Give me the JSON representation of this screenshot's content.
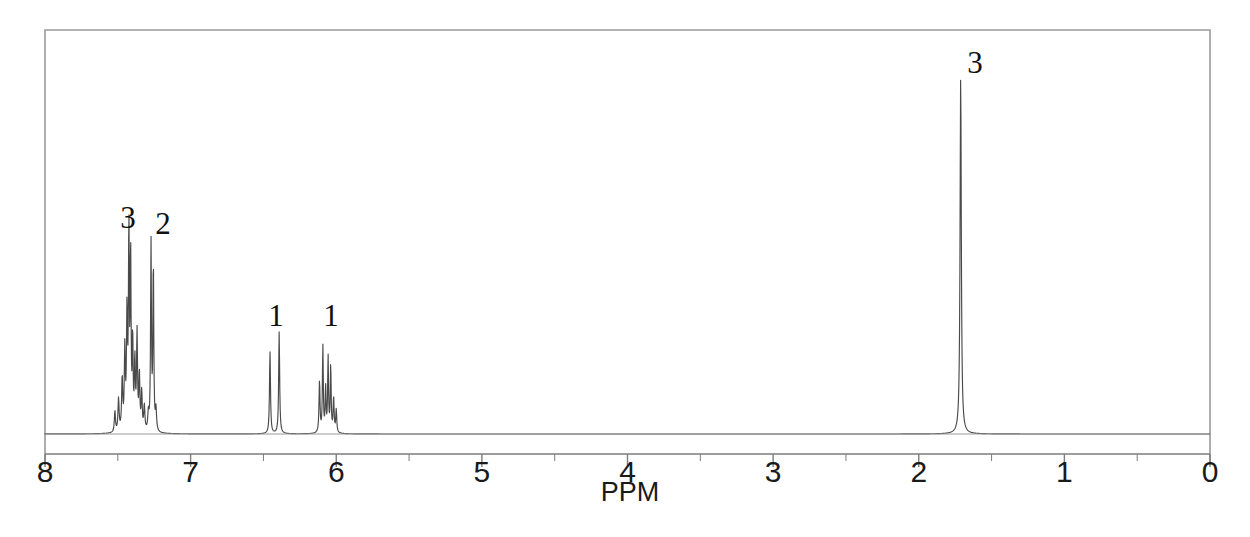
{
  "figure": {
    "kind": "nmr-spectrum",
    "background_color": "#ffffff",
    "trace_color": "#4a4a4a",
    "frame_color": "#9a9a9a",
    "axis_color": "#7d7d7d",
    "label_color": "#1a1a1a",
    "width": 1250,
    "height": 537
  },
  "frame": {
    "left": 45,
    "top": 30,
    "right": 1210,
    "bottom": 434
  },
  "axis": {
    "title": "PPM",
    "title_x": 630,
    "title_y": 482,
    "line_y": 454,
    "left_x": 45,
    "right_x": 1210,
    "ppm_min": 0,
    "ppm_max": 8,
    "px_per_ppm": 145.9,
    "major_tick_length": 13,
    "minor_tick_length": 7,
    "major_ticks": [
      8,
      7,
      6,
      5,
      4,
      3,
      2,
      1,
      0
    ],
    "minor_ticks": [
      7.5,
      6.5,
      5.5,
      4.5,
      3.5,
      2.5,
      1.5,
      0.5
    ],
    "tick_labels": [
      "8",
      "7",
      "6",
      "5",
      "4",
      "3",
      "2",
      "1",
      "0"
    ],
    "tick_label_y": 460
  },
  "baseline": {
    "y": 434
  },
  "chart_data": {
    "type": "line",
    "title": "",
    "subtitle": "",
    "xlabel": "PPM",
    "ylabel": "",
    "xlim": [
      8,
      0
    ],
    "ylim": [
      0,
      1
    ],
    "x_reversed": true,
    "grid": false,
    "legend": "none",
    "annotations": [
      {
        "text": "3",
        "ppm": 7.42,
        "x_px": 128,
        "y_px": 228,
        "role": "integral-count"
      },
      {
        "text": "2",
        "ppm": 7.26,
        "x_px": 163,
        "y_px": 234,
        "role": "integral-count"
      },
      {
        "text": "1",
        "ppm": 6.42,
        "x_px": 276,
        "y_px": 326,
        "role": "integral-count"
      },
      {
        "text": "1",
        "ppm": 6.05,
        "x_px": 331,
        "y_px": 326,
        "role": "integral-count"
      },
      {
        "text": "3",
        "ppm": 1.71,
        "x_px": 975,
        "y_px": 73,
        "role": "integral-count"
      }
    ],
    "peaks": [
      {
        "ppm": 7.52,
        "height": 0.055,
        "width_ppm": 0.009,
        "group": "aromatic-a"
      },
      {
        "ppm": 7.495,
        "height": 0.085,
        "width_ppm": 0.009,
        "group": "aromatic-a"
      },
      {
        "ppm": 7.47,
        "height": 0.135,
        "width_ppm": 0.009,
        "group": "aromatic-a"
      },
      {
        "ppm": 7.452,
        "height": 0.205,
        "width_ppm": 0.008,
        "group": "aromatic-a"
      },
      {
        "ppm": 7.437,
        "height": 0.3,
        "width_ppm": 0.008,
        "group": "aromatic-a"
      },
      {
        "ppm": 7.424,
        "height": 0.52,
        "width_ppm": 0.007,
        "group": "aromatic-a"
      },
      {
        "ppm": 7.412,
        "height": 0.455,
        "width_ppm": 0.007,
        "group": "aromatic-a"
      },
      {
        "ppm": 7.398,
        "height": 0.23,
        "width_ppm": 0.007,
        "group": "aromatic-a"
      },
      {
        "ppm": 7.383,
        "height": 0.175,
        "width_ppm": 0.008,
        "group": "aromatic-a"
      },
      {
        "ppm": 7.368,
        "height": 0.25,
        "width_ppm": 0.008,
        "group": "aromatic-a"
      },
      {
        "ppm": 7.352,
        "height": 0.145,
        "width_ppm": 0.008,
        "group": "aromatic-a"
      },
      {
        "ppm": 7.336,
        "height": 0.1,
        "width_ppm": 0.008,
        "group": "aromatic-a"
      },
      {
        "ppm": 7.318,
        "height": 0.065,
        "width_ppm": 0.009,
        "group": "aromatic-a"
      },
      {
        "ppm": 7.29,
        "height": 0.045,
        "width_ppm": 0.009,
        "group": "aromatic-b"
      },
      {
        "ppm": 7.272,
        "height": 0.49,
        "width_ppm": 0.007,
        "group": "aromatic-b"
      },
      {
        "ppm": 7.256,
        "height": 0.44,
        "width_ppm": 0.007,
        "group": "aromatic-b"
      },
      {
        "ppm": 7.238,
        "height": 0.055,
        "width_ppm": 0.009,
        "group": "aromatic-b"
      },
      {
        "ppm": 6.455,
        "height": 0.215,
        "width_ppm": 0.008,
        "group": "vinyl-d"
      },
      {
        "ppm": 6.392,
        "height": 0.265,
        "width_ppm": 0.008,
        "group": "vinyl-d"
      },
      {
        "ppm": 6.115,
        "height": 0.135,
        "width_ppm": 0.008,
        "group": "vinyl-m"
      },
      {
        "ppm": 6.092,
        "height": 0.225,
        "width_ppm": 0.007,
        "group": "vinyl-m"
      },
      {
        "ppm": 6.073,
        "height": 0.115,
        "width_ppm": 0.007,
        "group": "vinyl-m"
      },
      {
        "ppm": 6.056,
        "height": 0.195,
        "width_ppm": 0.007,
        "group": "vinyl-m"
      },
      {
        "ppm": 6.038,
        "height": 0.175,
        "width_ppm": 0.007,
        "group": "vinyl-m"
      },
      {
        "ppm": 6.018,
        "height": 0.09,
        "width_ppm": 0.008,
        "group": "vinyl-m"
      },
      {
        "ppm": 6.0,
        "height": 0.06,
        "width_ppm": 0.008,
        "group": "vinyl-m"
      },
      {
        "ppm": 1.712,
        "height": 0.935,
        "width_ppm": 0.01,
        "group": "methyl-s"
      }
    ]
  }
}
